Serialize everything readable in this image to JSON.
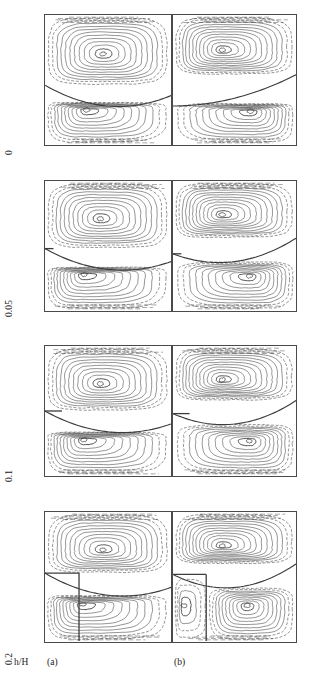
{
  "figure": {
    "axis_title": "h/H",
    "row_labels": [
      "0",
      "0.05",
      "0.1",
      "0.2"
    ],
    "column_labels": [
      "(a)",
      "(b)"
    ],
    "line_color": "#3c3c3c",
    "border_color": "#4a4a4a",
    "background_color": "#ffffff"
  },
  "chart_data": {
    "type": "line",
    "title": "",
    "xlabel": "",
    "ylabel": "h/H",
    "rows": [
      {
        "h_over_H": "0",
        "baffle_height_fraction": 0.0,
        "panels": [
          {
            "label": "(a)",
            "vortices": [
              {
                "name": "upper-primary",
                "cx": 0.46,
                "cy": 0.3,
                "rotation": "clockwise",
                "contour_count": 11
              },
              {
                "name": "lower-primary",
                "cx": 0.33,
                "cy": 0.73,
                "rotation": "clockwise",
                "contour_count": 10
              }
            ],
            "separatrix": {
              "left_y": 0.54,
              "mid_y": 0.7,
              "right_y": 0.62,
              "type": "concave-down-sagging"
            },
            "step_present": false
          },
          {
            "label": "(b)",
            "vortices": [
              {
                "name": "upper-primary",
                "cx": 0.4,
                "cy": 0.27,
                "rotation": "clockwise",
                "contour_count": 12
              },
              {
                "name": "lower-primary",
                "cx": 0.63,
                "cy": 0.74,
                "rotation": "clockwise",
                "contour_count": 10
              }
            ],
            "separatrix": {
              "left_y": 0.7,
              "mid_y": 0.64,
              "right_y": 0.46,
              "type": "rising-to-right"
            },
            "step_present": false
          }
        ]
      },
      {
        "h_over_H": "0.05",
        "baffle_height_fraction": 0.05,
        "panels": [
          {
            "label": "(a)",
            "vortices": [
              {
                "name": "upper-primary",
                "cx": 0.44,
                "cy": 0.29,
                "rotation": "clockwise",
                "contour_count": 11
              },
              {
                "name": "lower-primary",
                "cx": 0.31,
                "cy": 0.72,
                "rotation": "clockwise",
                "contour_count": 10
              }
            ],
            "separatrix": {
              "left_y": 0.52,
              "mid_y": 0.68,
              "right_y": 0.62,
              "type": "concave-down-sagging"
            },
            "step_present": true,
            "step_size": 0.05
          },
          {
            "label": "(b)",
            "vortices": [
              {
                "name": "upper-primary",
                "cx": 0.4,
                "cy": 0.26,
                "rotation": "clockwise",
                "contour_count": 12
              },
              {
                "name": "lower-primary",
                "cx": 0.62,
                "cy": 0.73,
                "rotation": "clockwise",
                "contour_count": 10
              }
            ],
            "separatrix": {
              "left_y": 0.56,
              "mid_y": 0.62,
              "right_y": 0.44,
              "type": "rising-to-right"
            },
            "step_present": true,
            "step_size": 0.05
          }
        ]
      },
      {
        "h_over_H": "0.1",
        "baffle_height_fraction": 0.1,
        "panels": [
          {
            "label": "(a)",
            "vortices": [
              {
                "name": "upper-primary",
                "cx": 0.44,
                "cy": 0.29,
                "rotation": "clockwise",
                "contour_count": 11
              },
              {
                "name": "lower-primary",
                "cx": 0.31,
                "cy": 0.72,
                "rotation": "clockwise",
                "contour_count": 10
              }
            ],
            "separatrix": {
              "left_y": 0.5,
              "mid_y": 0.66,
              "right_y": 0.6,
              "type": "concave-down-sagging"
            },
            "step_present": true,
            "step_size": 0.1
          },
          {
            "label": "(b)",
            "vortices": [
              {
                "name": "upper-primary",
                "cx": 0.4,
                "cy": 0.26,
                "rotation": "clockwise",
                "contour_count": 12
              },
              {
                "name": "lower-primary",
                "cx": 0.62,
                "cy": 0.73,
                "rotation": "clockwise",
                "contour_count": 10
              }
            ],
            "separatrix": {
              "left_y": 0.52,
              "mid_y": 0.6,
              "right_y": 0.42,
              "type": "rising-to-right"
            },
            "step_present": true,
            "step_size": 0.1
          }
        ]
      },
      {
        "h_over_H": "0.2",
        "baffle_height_fraction": 0.2,
        "panels": [
          {
            "label": "(a)",
            "vortices": [
              {
                "name": "upper-primary",
                "cx": 0.46,
                "cy": 0.29,
                "rotation": "clockwise",
                "contour_count": 11
              },
              {
                "name": "lower-primary",
                "cx": 0.3,
                "cy": 0.71,
                "rotation": "clockwise",
                "contour_count": 10
              }
            ],
            "separatrix": {
              "left_y": 0.47,
              "mid_y": 0.64,
              "right_y": 0.58,
              "type": "concave-down-sagging"
            },
            "step_present": true,
            "step_size": 0.2
          },
          {
            "label": "(b)",
            "vortices": [
              {
                "name": "upper-primary",
                "cx": 0.4,
                "cy": 0.26,
                "rotation": "clockwise",
                "contour_count": 12
              },
              {
                "name": "lower-primary",
                "cx": 0.6,
                "cy": 0.72,
                "rotation": "clockwise",
                "contour_count": 10
              },
              {
                "name": "corner-secondary",
                "cx": 0.09,
                "cy": 0.72,
                "rotation": "counter-clockwise",
                "contour_count": 4
              }
            ],
            "separatrix": {
              "left_y": 0.48,
              "mid_y": 0.58,
              "right_y": 0.4,
              "type": "rising-to-right"
            },
            "step_present": true,
            "step_size": 0.2
          }
        ]
      }
    ],
    "layout": {
      "rows": 4,
      "columns": 2,
      "row_tops_px": [
        14,
        180,
        345,
        511
      ],
      "row_height_px": 132,
      "grid_on": false,
      "legend": "none"
    }
  }
}
